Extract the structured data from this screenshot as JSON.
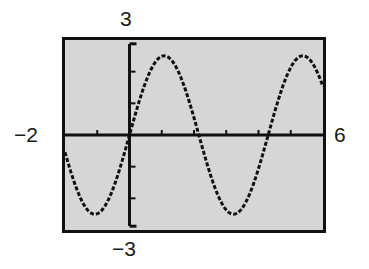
{
  "figure": {
    "kind": "graphing-calculator-screen",
    "background_color": "#ffffff",
    "screen_fill_color": "#d6d6d6",
    "frame_color": "#111111",
    "curve_color": "#111111"
  },
  "labels": {
    "y_max": "3",
    "y_min": "−3",
    "x_min": "−2",
    "x_max": "6"
  },
  "chart_data": {
    "type": "line",
    "title": "",
    "subtitle": "",
    "xlabel": "",
    "ylabel": "",
    "xlim": [
      -2,
      6
    ],
    "ylim": [
      -3,
      3
    ],
    "grid": false,
    "legend": "none",
    "axes": {
      "x_axis_drawn": true,
      "y_axis_drawn": true,
      "x_tick_spacing": 1,
      "y_tick_spacing": 1,
      "x_ticks": [
        -1,
        1,
        2,
        3,
        4,
        5
      ],
      "y_ticks": [
        -2,
        -1,
        1,
        2
      ]
    },
    "annotations": [
      "window x from -2 to 6",
      "window y from -3 to 3"
    ],
    "series": [
      {
        "name": "y = 2.5 sin(1.46 x)",
        "amplitude": 2.5,
        "period": 4.3,
        "phase": 0,
        "vertical_shift": 0,
        "style": "dashed-pixelated",
        "key_points": {
          "maxima_x": [
            0.78,
            5.08
          ],
          "minima_x": [
            -1.37,
            3.37
          ],
          "zero_crossings_x": [
            -2.0,
            0.0,
            2.15,
            4.3
          ],
          "max_y": 2.5,
          "min_y": -2.5
        },
        "x": [
          -2.0,
          -1.9,
          -1.8,
          -1.7,
          -1.6,
          -1.5,
          -1.4,
          -1.3,
          -1.2,
          -1.1,
          -1.0,
          -0.9,
          -0.8,
          -0.7,
          -0.6,
          -0.5,
          -0.4,
          -0.3,
          -0.2,
          -0.1,
          0.0,
          0.1,
          0.2,
          0.3,
          0.4,
          0.5,
          0.6,
          0.7,
          0.8,
          0.9,
          1.0,
          1.1,
          1.2,
          1.3,
          1.4,
          1.5,
          1.6,
          1.7,
          1.8,
          1.9,
          2.0,
          2.1,
          2.2,
          2.3,
          2.4,
          2.5,
          2.6,
          2.7,
          2.8,
          2.9,
          3.0,
          3.1,
          3.2,
          3.3,
          3.4,
          3.5,
          3.6,
          3.7,
          3.8,
          3.9,
          4.0,
          4.1,
          4.2,
          4.3,
          4.4,
          4.5,
          4.6,
          4.7,
          4.8,
          4.9,
          5.0,
          5.1,
          5.2,
          5.3,
          5.4,
          5.5,
          5.6,
          5.7,
          5.8,
          5.9,
          6.0
        ],
        "y": [
          -0.14,
          -0.49,
          -0.83,
          -1.14,
          -1.44,
          -1.71,
          -1.95,
          -2.15,
          -2.31,
          -2.42,
          -2.49,
          -2.5,
          -2.47,
          -2.39,
          -2.26,
          -2.09,
          -1.88,
          -1.63,
          -1.35,
          -1.05,
          -0.73,
          -0.4,
          -0.06,
          0.29,
          0.63,
          0.96,
          1.27,
          1.56,
          1.82,
          2.05,
          2.24,
          2.39,
          2.48,
          2.5,
          2.49,
          2.42,
          2.3,
          2.14,
          1.94,
          1.7,
          1.42,
          1.12,
          0.8,
          0.47,
          0.12,
          -0.22,
          -0.56,
          -0.89,
          -1.2,
          -1.49,
          -1.75,
          -1.98,
          -2.18,
          -2.34,
          -2.45,
          -2.5,
          -2.5,
          -2.45,
          -2.35,
          -2.2,
          -2.01,
          -1.77,
          -1.5,
          -1.2,
          -0.87,
          -0.54,
          -0.19,
          0.16,
          0.5,
          0.84,
          1.15,
          1.45,
          1.72,
          1.96,
          2.16,
          2.32,
          2.44,
          2.5,
          2.5,
          2.46,
          2.36
        ]
      }
    ]
  }
}
